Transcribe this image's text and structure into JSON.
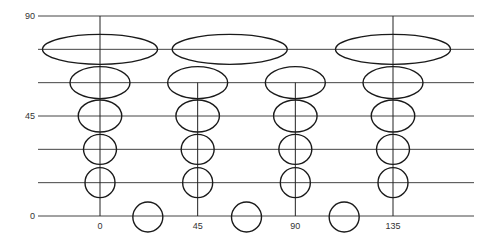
{
  "diagram": {
    "title": "",
    "y_axis": {
      "labels": [
        {
          "value": 90,
          "text": "90"
        },
        {
          "value": 45,
          "text": "45"
        },
        {
          "value": 0,
          "text": "0"
        }
      ],
      "gridline_values": [
        90,
        75,
        60,
        45,
        30,
        15,
        0
      ]
    },
    "x_axis": {
      "labels": [
        {
          "value": 0,
          "text": "0"
        },
        {
          "value": 45,
          "text": "45"
        },
        {
          "value": 90,
          "text": "90"
        },
        {
          "value": 135,
          "text": "135"
        }
      ]
    },
    "columns": [
      {
        "longitude": 0,
        "vertical_from": 90,
        "ellipse_rows": [
          75,
          60,
          45,
          30,
          15
        ],
        "relative_widths": [
          3.9,
          2.0,
          1.45,
          1.1,
          1.0
        ]
      },
      {
        "longitude": 45,
        "vertical_from": 60,
        "ellipse_rows": [
          60,
          45,
          30,
          15
        ],
        "relative_widths": [
          2.0,
          1.45,
          1.1,
          1.0
        ]
      },
      {
        "longitude": 90,
        "vertical_from": 60,
        "ellipse_rows": [
          60,
          45,
          30,
          15
        ],
        "relative_widths": [
          2.0,
          1.45,
          1.1,
          1.0
        ]
      },
      {
        "longitude": 135,
        "vertical_from": 90,
        "ellipse_rows": [
          75,
          60,
          45,
          30,
          15
        ],
        "relative_widths": [
          3.9,
          2.0,
          1.45,
          1.1,
          1.0
        ]
      }
    ],
    "top_ellipse_center_longitudes": [
      0,
      60,
      135
    ],
    "equator_circles_longitudes": [
      22.5,
      67.5,
      112.5
    ]
  }
}
